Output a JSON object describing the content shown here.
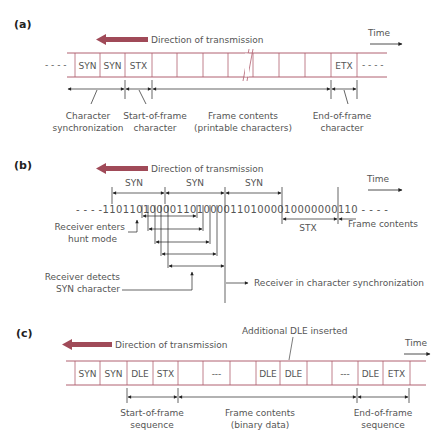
{
  "colors": {
    "frame": "#b06070",
    "arrow": "#a04a58",
    "ink": "#333333",
    "text": "#555555"
  },
  "panel_a": {
    "label": "(a)",
    "direction": "Direction of transmission",
    "time": "Time",
    "leading_dots": "- - - -",
    "trailing_dots": "- - - -",
    "cells": [
      "SYN",
      "SYN",
      "STX",
      "",
      "",
      "",
      "",
      "",
      "",
      "",
      "ETX"
    ],
    "annotations": {
      "char_sync": [
        "Character",
        "synchronization"
      ],
      "start_frame": [
        "Start-of-frame",
        "character"
      ],
      "frame_contents": [
        "Frame contents",
        "(printable characters)"
      ],
      "end_frame": [
        "End-of-frame",
        "character"
      ]
    }
  },
  "panel_b": {
    "label": "(b)",
    "direction": "Direction of transmission",
    "time": "Time",
    "syn_labels": [
      "SYN",
      "SYN",
      "SYN"
    ],
    "bitstream": "- - - - 1 1 0 1 1 0 1 0 0 0 0 1 1 0 1 0 0 0 0 1 1 0 1 0 0 0 0 1 0 0 0 0 0 0 0 1 1 0 - - - -",
    "bits_display": "- - - -11011010000110100001101000010000000110 - - - -",
    "stx_label": "STX",
    "frame_contents": "Frame contents",
    "hunt_mode": [
      "Receiver enters",
      "hunt mode"
    ],
    "detects_syn": [
      "Receiver detects",
      "SYN character"
    ],
    "in_sync": "Receiver in character synchronization"
  },
  "panel_c": {
    "label": "(c)",
    "direction": "Direction of transmission",
    "time": "Time",
    "additional_dle": "Additional DLE inserted",
    "cells": [
      "SYN",
      "SYN",
      "DLE",
      "STX",
      "",
      "---",
      "",
      "DLE",
      "DLE",
      "",
      "---",
      "DLE",
      "ETX"
    ],
    "annotations": {
      "start_seq": [
        "Start-of-frame",
        "sequence"
      ],
      "frame_contents": [
        "Frame contents",
        "(binary data)"
      ],
      "end_seq": [
        "End-of-frame",
        "sequence"
      ]
    }
  }
}
